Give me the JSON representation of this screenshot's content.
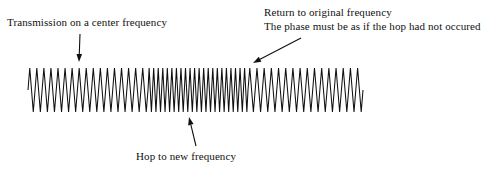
{
  "figure": {
    "title_alt": "Frequency hopping waveform with phase continuity",
    "background_color": "#ffffff",
    "width": 487,
    "height": 181
  },
  "annotations": {
    "transmission": {
      "text": "Transmission on a center frequency",
      "x": 7,
      "y": 16
    },
    "return_line1": {
      "text": "Return to original frequency",
      "x": 264,
      "y": 6
    },
    "return_line2": {
      "text": "The phase must be as if the hop had not occured",
      "x": 264,
      "y": 20
    },
    "hop": {
      "text": "Hop to new frequency",
      "x": 136,
      "y": 150
    }
  },
  "arrows": [
    {
      "name": "transmission-arrow",
      "direction": "down",
      "x1": 80,
      "y1": 34,
      "x2": 79,
      "y2": 62
    },
    {
      "name": "return-arrow",
      "direction": "down-left",
      "x1": 301,
      "y1": 38,
      "x2": 253,
      "y2": 63
    },
    {
      "name": "hop-arrow",
      "direction": "up",
      "x1": 196,
      "y1": 146,
      "x2": 189,
      "y2": 117
    }
  ],
  "chart_data": {
    "type": "line",
    "title": "",
    "xlabel": "",
    "ylabel": "",
    "grid": false,
    "legend": null,
    "stroke_color": "#101010",
    "baseline_y": 90,
    "amplitude": 22,
    "x_start": 28,
    "x_end": 363,
    "segments": [
      {
        "name": "center-frequency-before-hop",
        "x_start": 28,
        "x_end": 148,
        "cycles": 17,
        "period_px": 7.06,
        "frequency_relative": 1.0
      },
      {
        "name": "hopped-frequency",
        "x_start": 148,
        "x_end": 248,
        "cycles": 22,
        "period_px": 4.55,
        "frequency_relative": 1.55
      },
      {
        "name": "center-frequency-after-hop",
        "x_start": 248,
        "x_end": 363,
        "cycles": 16,
        "period_px": 7.19,
        "frequency_relative": 1.0
      }
    ]
  }
}
